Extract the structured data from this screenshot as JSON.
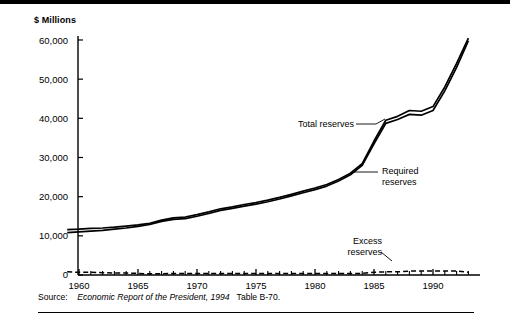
{
  "figure": {
    "y_axis_title": "$ Millions",
    "source": {
      "label": "Source:",
      "italic_part": "Economic Report of the President, 1994",
      "tail_part": "Table B-70."
    },
    "annotations": [
      {
        "name": "total-reserves",
        "lines": [
          "Total reserves"
        ]
      },
      {
        "name": "required-reserves",
        "lines": [
          "Required",
          "reserves"
        ]
      },
      {
        "name": "excess-reserves",
        "lines": [
          "Excess",
          "reserves"
        ]
      }
    ]
  },
  "chart_data": {
    "type": "line",
    "title": "",
    "subtitle": "",
    "xlabel": "",
    "ylabel": "$ Millions",
    "xlim": [
      1959,
      1993
    ],
    "ylim": [
      0,
      65000
    ],
    "grid": false,
    "legend_position": "inline-annotations",
    "ytick_labels": [
      "0",
      "10,000",
      "20,000",
      "30,000",
      "40,000",
      "50,000",
      "60,000"
    ],
    "ytick_values": [
      0,
      10000,
      20000,
      30000,
      40000,
      50000,
      60000
    ],
    "xtick_labels": [
      "1960",
      "1965",
      "1970",
      "1975",
      "1980",
      "1985",
      "1990"
    ],
    "xtick_values": [
      1960,
      1965,
      1970,
      1975,
      1980,
      1985,
      1990
    ],
    "minor_xtick_interval": 1,
    "x": [
      1959,
      1960,
      1961,
      1962,
      1963,
      1964,
      1965,
      1966,
      1967,
      1968,
      1969,
      1970,
      1971,
      1972,
      1973,
      1974,
      1975,
      1976,
      1977,
      1978,
      1979,
      1980,
      1981,
      1982,
      1983,
      1984,
      1985,
      1986,
      1987,
      1988,
      1989,
      1990,
      1991,
      1992,
      1993
    ],
    "series": [
      {
        "name": "Total reserves",
        "style": "solid",
        "color": "#000000",
        "values": [
          11600,
          11700,
          11900,
          12000,
          12200,
          12500,
          12800,
          13200,
          14000,
          14600,
          14800,
          15400,
          16100,
          16900,
          17400,
          18000,
          18500,
          19100,
          19800,
          20600,
          21400,
          22200,
          23100,
          24400,
          26000,
          28400,
          34200,
          39500,
          40500,
          42000,
          41800,
          43000,
          48000,
          54000,
          60500
        ]
      },
      {
        "name": "Required reserves",
        "style": "solid",
        "color": "#000000",
        "values": [
          10800,
          11000,
          11200,
          11400,
          11700,
          12000,
          12400,
          12900,
          13700,
          14200,
          14400,
          15000,
          15700,
          16500,
          17000,
          17600,
          18100,
          18700,
          19400,
          20200,
          21000,
          21800,
          22700,
          24000,
          25600,
          28000,
          33500,
          38700,
          39700,
          41000,
          40800,
          42000,
          47000,
          53000,
          59800
        ]
      },
      {
        "name": "Excess reserves",
        "style": "dashed",
        "color": "#000000",
        "values": [
          800,
          700,
          700,
          600,
          500,
          500,
          400,
          300,
          300,
          400,
          400,
          400,
          400,
          400,
          400,
          400,
          400,
          400,
          400,
          400,
          400,
          400,
          400,
          400,
          400,
          400,
          700,
          800,
          800,
          1000,
          1000,
          1000,
          1000,
          1000,
          700
        ]
      }
    ]
  }
}
